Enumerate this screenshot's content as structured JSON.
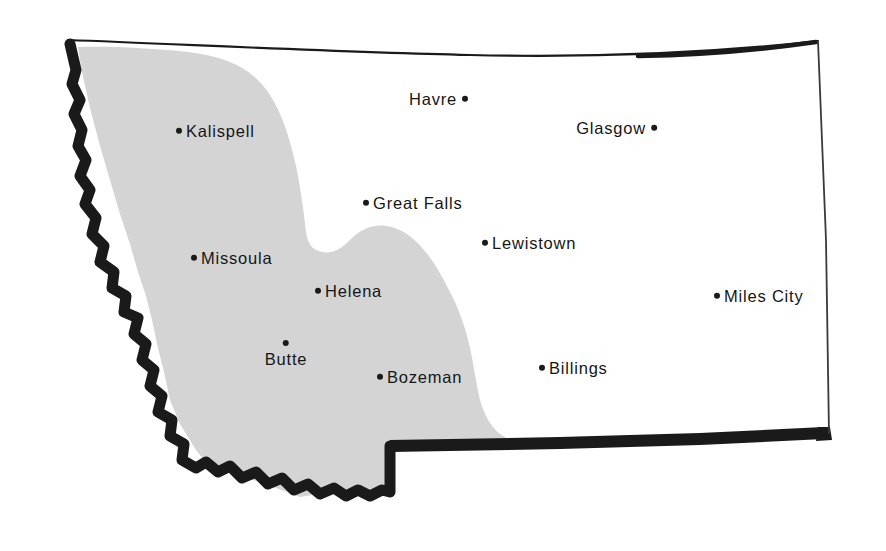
{
  "map": {
    "title": "Montana",
    "canvas": {
      "width": 886,
      "height": 551
    },
    "colors": {
      "background": "#ffffff",
      "shaded_region": "#d4d4d4",
      "heavy_border": "#1a1a1a",
      "thin_border": "#3a3a3a",
      "label_text": "#161616",
      "dot": "#1a1a1a"
    },
    "shaded_region_name": "western-mountain-region"
  },
  "cities": [
    {
      "name": "Havre",
      "dot_x": 468,
      "dot_y": 99,
      "side": "right"
    },
    {
      "name": "Glasgow",
      "dot_x": 657,
      "dot_y": 128,
      "side": "right"
    },
    {
      "name": "Kalispell",
      "dot_x": 176,
      "dot_y": 131,
      "side": "left"
    },
    {
      "name": "Great Falls",
      "dot_x": 363,
      "dot_y": 203,
      "side": "left"
    },
    {
      "name": "Lewistown",
      "dot_x": 482,
      "dot_y": 243,
      "side": "left"
    },
    {
      "name": "Missoula",
      "dot_x": 191,
      "dot_y": 258,
      "side": "left"
    },
    {
      "name": "Helena",
      "dot_x": 315,
      "dot_y": 291,
      "side": "left"
    },
    {
      "name": "Miles City",
      "dot_x": 714,
      "dot_y": 296,
      "side": "left"
    },
    {
      "name": "Butte",
      "dot_x": 286,
      "dot_y": 340,
      "side": "top"
    },
    {
      "name": "Bozeman",
      "dot_x": 377,
      "dot_y": 377,
      "side": "left"
    },
    {
      "name": "Billings",
      "dot_x": 539,
      "dot_y": 368,
      "side": "left"
    }
  ]
}
